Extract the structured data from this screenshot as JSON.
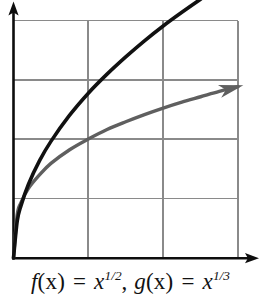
{
  "figure": {
    "caption_left": {
      "function_name": "f",
      "argument": "(x)",
      "equals": " = ",
      "base": "x",
      "exponent": "1/2"
    },
    "caption_separator": ",",
    "caption_right": {
      "function_name": "g",
      "argument": "(x)",
      "equals": " = ",
      "base": "x",
      "exponent": "1/3"
    },
    "caption_full": "f(x) = x^1/2,  g(x) = x^1/3"
  },
  "colors": {
    "axis": "#0d0d0d",
    "grid": "#8a8a8a",
    "curve_f": "#111111",
    "curve_g": "#5f5f5f",
    "background": "#ffffff"
  },
  "chart_data": {
    "type": "line",
    "title": "",
    "subtitle": "",
    "xlabel": "",
    "ylabel": "",
    "xlim": [
      0,
      3
    ],
    "ylim": [
      0,
      4
    ],
    "grid": true,
    "grid_x_ticks": [
      0,
      1,
      2,
      3
    ],
    "grid_y_ticks": [
      0,
      1,
      2,
      3,
      4
    ],
    "xticklabels": [],
    "yticklabels": [],
    "legend": "none",
    "annotations": [
      "f(x) = x^1/2",
      "g(x) = x^1/3"
    ],
    "axis_arrows": {
      "x": "right",
      "y": "up"
    },
    "series": [
      {
        "name": "f(x) = x^1/2",
        "color": "#111111",
        "arrow_end": true,
        "x": [
          0,
          0.05,
          0.1,
          0.2,
          0.35,
          0.5,
          0.75,
          1.0,
          1.25,
          1.5,
          1.75,
          2.0,
          2.25,
          2.5,
          2.75,
          3.0
        ],
        "y": [
          0,
          0.62,
          0.88,
          1.24,
          1.64,
          1.96,
          2.4,
          2.77,
          3.09,
          3.38,
          3.65,
          3.9,
          4.13,
          4.35,
          4.56,
          4.76
        ]
      },
      {
        "name": "g(x) = x^1/3",
        "color": "#5f5f5f",
        "arrow_end": true,
        "x": [
          0,
          0.05,
          0.1,
          0.2,
          0.35,
          0.5,
          0.75,
          1.0,
          1.25,
          1.5,
          1.75,
          2.0,
          2.25,
          2.5,
          2.75,
          3.0
        ],
        "y": [
          0,
          0.73,
          0.93,
          1.17,
          1.4,
          1.59,
          1.82,
          2.0,
          2.16,
          2.29,
          2.41,
          2.52,
          2.62,
          2.71,
          2.8,
          2.88
        ]
      }
    ]
  }
}
